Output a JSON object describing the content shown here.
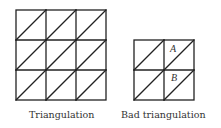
{
  "figures": [
    {
      "id": "triangulation",
      "caption": "Triangulation",
      "grid": {
        "x": 16,
        "y": 10,
        "cols": 3,
        "rows": 3,
        "cell": 30
      },
      "diagonals": "all cells split bottom-left to top-right",
      "labels": []
    },
    {
      "id": "bad-triangulation",
      "caption": "Bad triangulation",
      "grid": {
        "x": 134,
        "y": 40,
        "cols": 2,
        "rows": 2,
        "cell": 30
      },
      "diagonals": "all cells split bottom-left to top-right",
      "labels": [
        {
          "text": "A",
          "x": 173,
          "y": 52
        },
        {
          "text": "B",
          "x": 174,
          "y": 81
        }
      ]
    }
  ],
  "colors": {
    "stroke": "#222222",
    "text": "#333333",
    "background": "#ffffff"
  }
}
